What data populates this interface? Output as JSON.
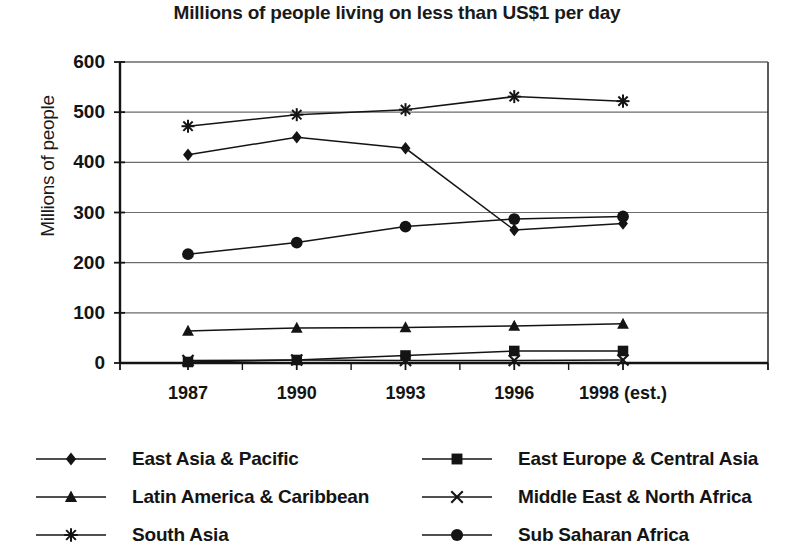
{
  "chart_data": {
    "type": "line",
    "title": "Millions of people living on less than US$1 per day",
    "xlabel": "",
    "ylabel": "Millions of people",
    "categories": [
      "1987",
      "1990",
      "1993",
      "1996",
      "1998 (est.)"
    ],
    "ylim": [
      0,
      600
    ],
    "ytick_values": [
      0,
      100,
      200,
      300,
      400,
      500,
      600
    ],
    "ytick_labels": [
      "0",
      "100",
      "200",
      "300",
      "400",
      "500",
      "600"
    ],
    "grid": true,
    "legend_position": "bottom",
    "series": [
      {
        "name": "East Asia & Pacific",
        "marker": "diamond",
        "values": [
          415,
          450,
          428,
          265,
          278
        ]
      },
      {
        "name": "East Europe & Central Asia",
        "marker": "square",
        "values": [
          2,
          6,
          15,
          24,
          24
        ]
      },
      {
        "name": "Latin America & Caribbean",
        "marker": "triangle",
        "values": [
          64,
          70,
          71,
          74,
          78
        ]
      },
      {
        "name": "Middle East & North Africa",
        "marker": "x",
        "values": [
          5,
          6,
          5,
          5,
          6
        ]
      },
      {
        "name": "South Asia",
        "marker": "asterisk",
        "values": [
          472,
          495,
          505,
          531,
          522
        ]
      },
      {
        "name": "Sub Saharan Africa",
        "marker": "circle",
        "values": [
          217,
          240,
          272,
          287,
          292
        ]
      }
    ]
  },
  "legend": {
    "left_column": [
      {
        "label": "East Asia & Pacific",
        "marker": "diamond"
      },
      {
        "label": "Latin America & Caribbean",
        "marker": "triangle"
      },
      {
        "label": "South Asia",
        "marker": "asterisk"
      }
    ],
    "right_column": [
      {
        "label": "East Europe & Central Asia",
        "marker": "square"
      },
      {
        "label": "Middle East & North Africa",
        "marker": "x"
      },
      {
        "label": "Sub Saharan Africa",
        "marker": "circle"
      }
    ]
  },
  "colors": {
    "ink": "#141414",
    "grid": "#6b6b6b",
    "axis": "#111111",
    "background": "#ffffff"
  }
}
